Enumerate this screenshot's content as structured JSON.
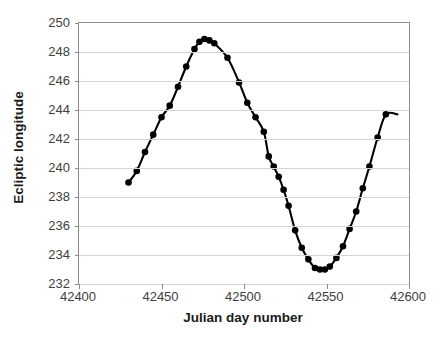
{
  "chart_data": {
    "type": "line",
    "title": "",
    "subtitle": "",
    "xlabel": "Julian day number",
    "ylabel": "Ecliptic longitude",
    "xlim": [
      42400,
      42600
    ],
    "ylim": [
      232,
      250
    ],
    "xticks": [
      42400,
      42450,
      42500,
      42550,
      42600
    ],
    "yticks": [
      232,
      234,
      236,
      238,
      240,
      242,
      244,
      246,
      248,
      250
    ],
    "grid": "horizontal",
    "legend": "none",
    "marker": "filled-circle",
    "marker_color": "#000000",
    "line_color": "#000000",
    "series": [
      {
        "name": "Ecliptic longitude",
        "x": [
          42430,
          42435,
          42440,
          42445,
          42450,
          42455,
          42460,
          42465,
          42470,
          42473,
          42476,
          42479,
          42482,
          42490,
          42497,
          42502,
          42507,
          42512,
          42515,
          42518,
          42521,
          42524,
          42527,
          42531,
          42535,
          42539,
          42543,
          42546,
          42549,
          42552,
          42556,
          42560,
          42564,
          42568,
          42572,
          42576,
          42581,
          42586
        ],
        "y": [
          239.0,
          239.8,
          241.1,
          242.3,
          243.5,
          244.3,
          245.6,
          247.0,
          248.2,
          248.7,
          248.9,
          248.8,
          248.6,
          247.6,
          245.9,
          244.5,
          243.5,
          242.5,
          240.8,
          240.1,
          239.4,
          238.5,
          237.4,
          235.7,
          234.5,
          233.7,
          233.1,
          233.0,
          233.0,
          233.2,
          233.8,
          234.6,
          235.8,
          237.0,
          238.6,
          240.1,
          242.1,
          243.7
        ]
      }
    ],
    "curve_extent": {
      "x_start": 42430,
      "x_end": 42593,
      "y_at_x_end": 243.7
    },
    "marker_count": 38
  },
  "axis": {
    "y_title": "Ecliptic longitude",
    "x_title": "Julian day number",
    "y_tick_labels": [
      "250",
      "248",
      "246",
      "244",
      "242",
      "240",
      "238",
      "236",
      "234",
      "232"
    ],
    "x_tick_labels": [
      "42400",
      "42450",
      "42500",
      "42550",
      "42600"
    ]
  },
  "colors": {
    "axis_line": "#8c8c8c",
    "gridline": "#d4d4d4",
    "tick_text": "#404040",
    "title_text": "#1a1a1a",
    "series": "#000000",
    "background": "#ffffff"
  }
}
